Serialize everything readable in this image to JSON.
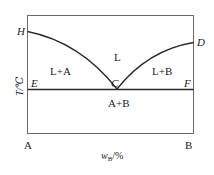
{
  "diagram": {
    "type": "binary eutectic phase diagram",
    "points": {
      "H": "H",
      "D": "D",
      "C": "C",
      "E": "E",
      "F": "F"
    },
    "regions": {
      "liquid": "L",
      "liquid_plus_a": "L+A",
      "liquid_plus_b": "L+B",
      "solid_a_plus_b": "A+B"
    },
    "axes": {
      "y_label": "T/℃",
      "x_label_main": "w",
      "x_label_sub": "B",
      "x_label_suffix": "/%",
      "x_left": "A",
      "x_right": "B"
    },
    "colors": {
      "line": "#2a2a2a",
      "frame": "#6a6a6a",
      "text": "#222222"
    }
  }
}
